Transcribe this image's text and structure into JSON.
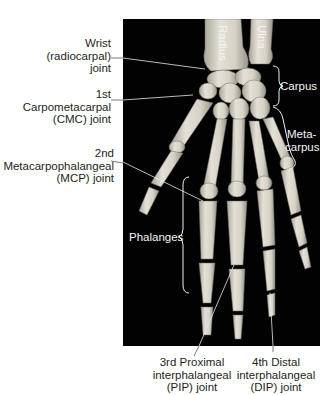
{
  "figure": {
    "background_color": "#020202",
    "bone_color": "#d9d5ca",
    "label_color_outside": "#231f20",
    "label_color_inside": "#f4f4f4",
    "leader_line_color": "#e8e8e8"
  },
  "labels": {
    "wrist": [
      "Wrist",
      "(radiocarpal)",
      "joint"
    ],
    "cmc": [
      "1st",
      "Carpometacarpal",
      "(CMC) joint"
    ],
    "mcp": [
      "2nd",
      "Metacarpophalangeal",
      "(MCP) joint"
    ],
    "pip": [
      "3rd Proximal",
      "interphalangeal",
      "(PIP) joint"
    ],
    "dip": [
      "4th Distal",
      "interphalangeal",
      "(DIP) joint"
    ],
    "radius": "Radius",
    "ulna": "Ulna",
    "carpus": "Carpus",
    "metacarpus": [
      "Meta-",
      "carpus"
    ],
    "phalanges": "Phalanges"
  }
}
